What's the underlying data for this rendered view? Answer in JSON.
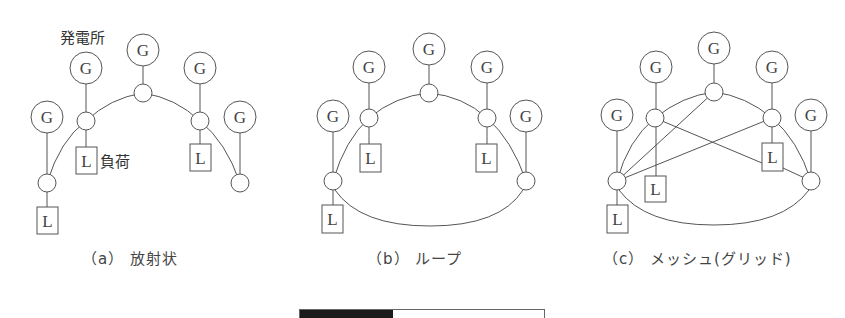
{
  "labels": {
    "power_station": "発電所",
    "load": "負荷",
    "generator_symbol": "G",
    "load_symbol": "L"
  },
  "captions": {
    "a": "（a） 放射状",
    "b": "（b） ループ",
    "c": "（c） メッシュ(グリッド)"
  },
  "colors": {
    "line": "#555555",
    "background": "#ffffff",
    "bar_fill": "#1a1a1a"
  },
  "progress_bar": {
    "filled_fraction": 0.38
  }
}
